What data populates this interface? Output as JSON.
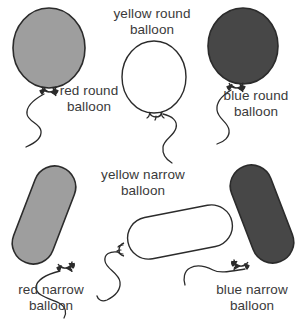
{
  "figure": {
    "title": "",
    "background_color": "#ffffff",
    "line_color": "#2b2b2b",
    "text_color": "#3a3a3a"
  },
  "balloons": [
    {
      "id": "red-round",
      "color_name": "red",
      "shape": "round",
      "label": "red round\nballoon",
      "fill_hex": "#9e9e9e",
      "outline_hex": "#2b2b2b"
    },
    {
      "id": "yellow-round",
      "color_name": "yellow",
      "shape": "round",
      "label": "yellow round\nballoon",
      "fill_hex": "#ffffff",
      "outline_hex": "#2b2b2b"
    },
    {
      "id": "blue-round",
      "color_name": "blue",
      "shape": "round",
      "label": "blue round\nballoon",
      "fill_hex": "#474747",
      "outline_hex": "#2b2b2b"
    },
    {
      "id": "red-narrow",
      "color_name": "red",
      "shape": "narrow",
      "label": "red narrow\nballoon",
      "fill_hex": "#9e9e9e",
      "outline_hex": "#2b2b2b"
    },
    {
      "id": "yellow-narrow",
      "color_name": "yellow",
      "shape": "narrow",
      "label": "yellow narrow\nballoon",
      "fill_hex": "#ffffff",
      "outline_hex": "#2b2b2b"
    },
    {
      "id": "blue-narrow",
      "color_name": "blue",
      "shape": "narrow",
      "label": "blue narrow\nballoon",
      "fill_hex": "#474747",
      "outline_hex": "#2b2b2b"
    }
  ]
}
